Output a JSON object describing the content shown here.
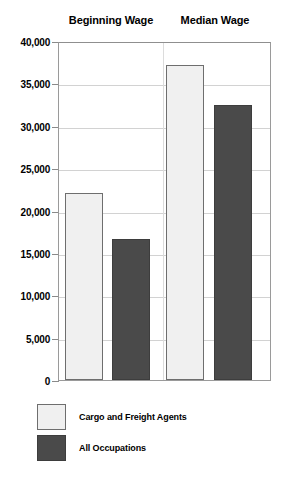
{
  "chart_data": {
    "type": "bar",
    "title": "",
    "subtitle": "",
    "xlabel": "",
    "ylabel": "",
    "categories": [
      "Beginning Wage",
      "Median Wage"
    ],
    "series": [
      {
        "name": "Cargo and Freight Agents",
        "color": "#f0f0f0",
        "values": [
          22100,
          37200
        ]
      },
      {
        "name": "All Occupations",
        "color": "#4a4a4a",
        "values": [
          16600,
          32400
        ]
      }
    ],
    "ylim": [
      0,
      40000
    ],
    "ytick_values": [
      0,
      5000,
      10000,
      15000,
      20000,
      25000,
      30000,
      35000,
      40000
    ],
    "ytick_labels": [
      "0",
      "5,000",
      "10,000",
      "15,000",
      "20,000",
      "25,000",
      "30,000",
      "35,000",
      "40,000"
    ],
    "grid": true,
    "legend_position": "bottom-left",
    "annotations": []
  },
  "legend": {
    "items": [
      {
        "label": "Cargo and Freight Agents",
        "swatch": "light"
      },
      {
        "label": "All Occupations",
        "swatch": "dark"
      }
    ]
  }
}
